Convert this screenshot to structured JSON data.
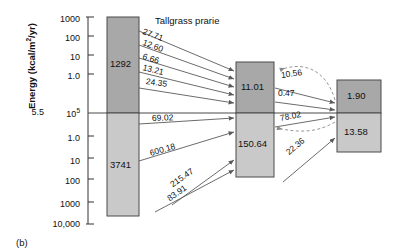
{
  "figure": {
    "panel_label": "(b)",
    "title": "Tallgrass prarie",
    "axis": {
      "ylabel_text": "Energy (kcal/m",
      "ylabel_sup": "2",
      "ylabel_tail": "/yr)",
      "center_prefix": "5.5",
      "center_mantissa": "10",
      "center_exponent": "5",
      "ticks_upper": [
        "1000",
        "100",
        "10",
        "1.0"
      ],
      "ticks_lower": [
        "1.0",
        "10",
        "100",
        "1000",
        "10,000"
      ]
    },
    "boxes": [
      {
        "name": "producers",
        "above": "1292",
        "below": "3741"
      },
      {
        "name": "consumers",
        "above": "11.01",
        "below": "150.64"
      },
      {
        "name": "top-consumers",
        "above": "1.90",
        "below": "13.58"
      }
    ],
    "flows": {
      "producers_to_consumers_above": [
        "27.71",
        "12.60",
        "6.66",
        "13.21",
        "24.35"
      ],
      "producers_to_consumers_below": [
        "69.02",
        "600.18"
      ],
      "into_consumers_below": [
        "215.47",
        "83.91"
      ],
      "consumers_to_top_above": [
        "10.56",
        "0.47"
      ],
      "consumers_to_top_below": [
        "78.02"
      ],
      "into_top_below": [
        "22.36"
      ]
    },
    "colors": {
      "box_fill_above": "#a8a8a8",
      "box_fill_below": "#c9c9c9",
      "stroke": "#4a4a4a",
      "axis": "#333333"
    }
  }
}
